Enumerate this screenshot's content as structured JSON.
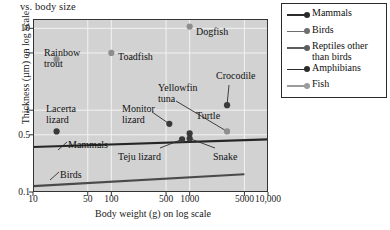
{
  "figure": {
    "title_fragment": "vs. body size",
    "ylabel": "Thickness (µm) on log scale",
    "xlabel": "Body weight (g) on log scale"
  },
  "legend": {
    "position": "top-right",
    "entries": [
      {
        "label": "Mammals",
        "color": "#2b2b2b"
      },
      {
        "label": "Birds",
        "color": "#6e6e6e"
      },
      {
        "label": "Reptiles other\nthan birds",
        "color": "#5d5d5d"
      },
      {
        "label": "Amphibians",
        "color": "#2b2b2b"
      },
      {
        "label": "Fish",
        "color": "#9b9b9b"
      }
    ]
  },
  "chart_data": {
    "type": "scatter",
    "title": "vs. body size",
    "xlabel": "Body weight (g) on log scale",
    "ylabel": "Thickness (µm) on log scale",
    "xscale": "log",
    "yscale": "log",
    "xlim": [
      10,
      10000
    ],
    "ylim": [
      0.1,
      13
    ],
    "grid": true,
    "xticks": [
      10,
      50,
      100,
      500,
      1000,
      5000,
      10000
    ],
    "xticklabels": [
      "10",
      "50",
      "100",
      "500",
      "1000",
      "5000",
      "10,000"
    ],
    "yticks": [
      0.1,
      0.5,
      1,
      5,
      10
    ],
    "yticklabels": [
      "0.1",
      "0.5",
      "1",
      "5",
      "10"
    ],
    "points": [
      {
        "name": "Rainbow trout",
        "x": 20,
        "y": 4.2,
        "group": "Fish",
        "color": "#8e8e8e",
        "label": "Rainbow\ntrout",
        "label_x": 44,
        "label_y": 48,
        "leader": false
      },
      {
        "name": "Toadfish",
        "x": 100,
        "y": 5.0,
        "group": "Fish",
        "color": "#8e8e8e",
        "label": "Toadfish",
        "label_x": 118,
        "label_y": 52,
        "leader": false
      },
      {
        "name": "Dogfish",
        "x": 1000,
        "y": 10.5,
        "group": "Fish",
        "color": "#8e8e8e",
        "label": "Dogfish",
        "label_x": 196,
        "label_y": 27,
        "leader": false
      },
      {
        "name": "Lacerta lizard",
        "x": 20,
        "y": 0.55,
        "group": "Reptiles other than birds",
        "color": "#3a3a3a",
        "label": "Lacerta\nlizard",
        "label_x": 46,
        "label_y": 104,
        "leader": false
      },
      {
        "name": "Monitor lizard",
        "x": 550,
        "y": 0.68,
        "group": "Reptiles other than birds",
        "color": "#3a3a3a",
        "label": "Monitor\nlizard",
        "label_x": 122,
        "label_y": 104,
        "leader": true
      },
      {
        "name": "Turtle",
        "x": 1000,
        "y": 0.52,
        "group": "Reptiles other than birds",
        "color": "#3a3a3a",
        "label": "Turtle",
        "label_x": 196,
        "label_y": 111,
        "leader": false
      },
      {
        "name": "Snake",
        "x": 1000,
        "y": 0.45,
        "group": "Reptiles other than birds",
        "color": "#3a3a3a",
        "label": "Snake",
        "label_x": 213,
        "label_y": 152,
        "leader": true
      },
      {
        "name": "Teju lizard",
        "x": 800,
        "y": 0.44,
        "group": "Reptiles other than birds",
        "color": "#3a3a3a",
        "label": "Teju lizard",
        "label_x": 118,
        "label_y": 152,
        "leader": true
      },
      {
        "name": "Crocodile",
        "x": 3000,
        "y": 1.15,
        "group": "Reptiles other than birds",
        "color": "#3a3a3a",
        "label": "Crocodile",
        "label_x": 216,
        "label_y": 71,
        "leader": true
      },
      {
        "name": "Yellowfin tuna",
        "x": 3000,
        "y": 0.55,
        "group": "Fish",
        "color": "#8e8e8e",
        "label": "Yellowfin\ntuna",
        "label_x": 158,
        "label_y": 83,
        "leader": true
      }
    ],
    "trend_lines": [
      {
        "name": "Mammals",
        "color": "#262626",
        "x0": 10,
        "y0": 0.355,
        "x1": 10000,
        "y1": 0.44,
        "label": "Mammals",
        "label_x": 68,
        "label_y": 139
      },
      {
        "name": "Birds",
        "color": "#4a4a4a",
        "x0": 10,
        "y0": 0.118,
        "x1": 5000,
        "y1": 0.165,
        "label": "Birds",
        "label_x": 60,
        "label_y": 169
      }
    ]
  }
}
